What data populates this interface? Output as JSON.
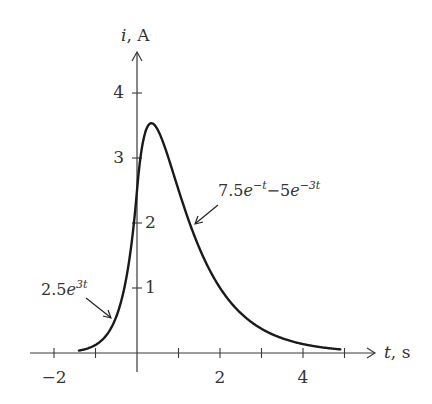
{
  "chart_data": {
    "type": "line",
    "title": "",
    "xlabel": "t, s",
    "ylabel": "i, A",
    "xlabel_var": "t",
    "xlabel_unit": "s",
    "ylabel_var": "i",
    "ylabel_unit": "A",
    "xlim": [
      -2.6,
      5.8
    ],
    "ylim": [
      0,
      4.5
    ],
    "grid": false,
    "legend": null,
    "x_ticks": [
      -2,
      -1,
      1,
      2,
      3,
      4,
      5
    ],
    "x_tick_labels": [
      {
        "value": -2,
        "label": "−2"
      },
      {
        "value": 2,
        "label": "2"
      },
      {
        "value": 4,
        "label": "4"
      }
    ],
    "y_ticks": [
      1,
      2,
      3,
      4
    ],
    "y_tick_labels": [
      {
        "value": 1,
        "label": "1"
      },
      {
        "value": 2,
        "label": "2"
      },
      {
        "value": 3,
        "label": "3"
      },
      {
        "value": 4,
        "label": "4"
      }
    ],
    "series": [
      {
        "name": "2.5e^{3t}",
        "domain": [
          -1.4,
          0
        ],
        "formula": "2.5*exp(3t)",
        "x": [
          -1.4,
          -1.2,
          -1.0,
          -0.8,
          -0.6,
          -0.4,
          -0.2,
          0.0
        ],
        "values": [
          0.04,
          0.07,
          0.12,
          0.23,
          0.41,
          0.75,
          1.37,
          2.5
        ]
      },
      {
        "name": "7.5e^{-t} - 5e^{-3t}",
        "domain": [
          0,
          4.9
        ],
        "formula": "7.5*exp(-t) - 5*exp(-3t)",
        "x": [
          0.0,
          0.2,
          0.35,
          0.5,
          1.0,
          1.5,
          2.0,
          2.5,
          3.0,
          3.5,
          4.0,
          4.5,
          4.9
        ],
        "values": [
          2.5,
          3.4,
          3.54,
          3.43,
          2.51,
          1.62,
          1.0,
          0.61,
          0.37,
          0.23,
          0.14,
          0.08,
          0.06
        ]
      }
    ],
    "peak": {
      "t": 0.35,
      "i": 3.54
    },
    "annotations": [
      {
        "id": "left",
        "base": "2.5e",
        "exp": "3t",
        "points_to_t": -0.6
      },
      {
        "id": "right",
        "base1": "7.5e",
        "exp1": "−t",
        "mid": "−5e",
        "exp2": "−3t",
        "points_to_t": 1.35
      }
    ]
  },
  "labels": {
    "y_axis_var": "i",
    "y_axis_unit": ", A",
    "x_axis_var": "t",
    "x_axis_unit": ", s",
    "tick_y_1": "1",
    "tick_y_2": "2",
    "tick_y_3": "3",
    "tick_y_4": "4",
    "tick_x_m2": "−2",
    "tick_x_2": "2",
    "tick_x_4": "4",
    "ann_left_base": "2.5",
    "ann_left_e": "e",
    "ann_left_exp": "3t",
    "ann_right_coef1": "7.5",
    "ann_right_e1": "e",
    "ann_right_exp1": "−t",
    "ann_right_mid": "−5",
    "ann_right_e2": "e",
    "ann_right_exp2": "−3t"
  }
}
